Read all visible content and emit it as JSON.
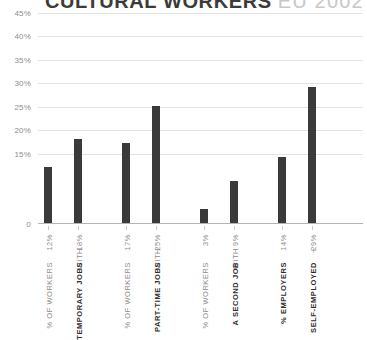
{
  "title": {
    "main": "CULTURAL WORKERS",
    "sub": "EU 2002"
  },
  "axis": {
    "y_ticks": [
      "45%",
      "40%",
      "35%",
      "30%",
      "25%",
      "20%",
      "15%",
      "0"
    ]
  },
  "colors": {
    "bar": "#3a3a3a",
    "gridline": "#e3e3e3",
    "baseline": "#b4b4b4",
    "title_main": "#3b3b3b",
    "title_sub": "#c8c8c8",
    "label_muted": "#8d8d8d",
    "label_bold": "#2e2e2e"
  },
  "bars": [
    {
      "value": "12%",
      "label_lead": "% OF WORKERS",
      "label_main": "",
      "label_pct": "12%"
    },
    {
      "value": "18%",
      "label_lead": "WITH",
      "label_main": "TEMPORARY JOBS",
      "label_pct": "18%"
    },
    {
      "value": "17%",
      "label_lead": "% OF WORKERS",
      "label_main": "",
      "label_pct": "17%"
    },
    {
      "value": "25%",
      "label_lead": "WITH",
      "label_main": "PART-TIME JOBS",
      "label_pct": "25%"
    },
    {
      "value": "3%",
      "label_lead": "% OF WORKERS",
      "label_main": "",
      "label_pct": "3%"
    },
    {
      "value": "9%",
      "label_lead": "WITH",
      "label_main": "A SECOND JOB",
      "label_pct": "9%"
    },
    {
      "value": "14%",
      "label_lead": "% EMPLOYERS",
      "label_main": "",
      "label_pct": "14%"
    },
    {
      "value": "29%",
      "label_lead": "+",
      "label_main": "SELF-EMPLOYED",
      "label_pct": "29%"
    }
  ],
  "chart_data": {
    "type": "bar",
    "subtitle": "EU 2002",
    "xlabel": "",
    "ylabel": "",
    "ylim": [
      0,
      45
    ],
    "grid": true,
    "legend": "none",
    "categories": [
      "% OF WORKERS 12%",
      "WITH TEMPORARY JOBS 18%",
      "% OF WORKERS 17%",
      "WITH PART-TIME JOBS 25%",
      "% OF WORKERS 3%",
      "WITH A SECOND JOB 9%",
      "% EMPLOYERS 14%",
      "+ SELF-EMPLOYED 29%"
    ],
    "values": [
      12,
      18,
      17,
      25,
      3,
      9,
      14,
      29
    ],
    "ytick_labels": [
      "45%",
      "40%",
      "35%",
      "30%",
      "25%",
      "20%",
      "15%",
      "0"
    ],
    "ytick_values": [
      45,
      40,
      35,
      30,
      25,
      20,
      15,
      0
    ],
    "groups": [
      {
        "name": "TEMPORARY JOBS",
        "values": [
          12,
          18
        ]
      },
      {
        "name": "PART-TIME JOBS",
        "values": [
          17,
          25
        ]
      },
      {
        "name": "A SECOND JOB",
        "values": [
          3,
          9
        ]
      },
      {
        "name": "SELF-EMPLOYED",
        "values": [
          14,
          29
        ]
      }
    ]
  }
}
